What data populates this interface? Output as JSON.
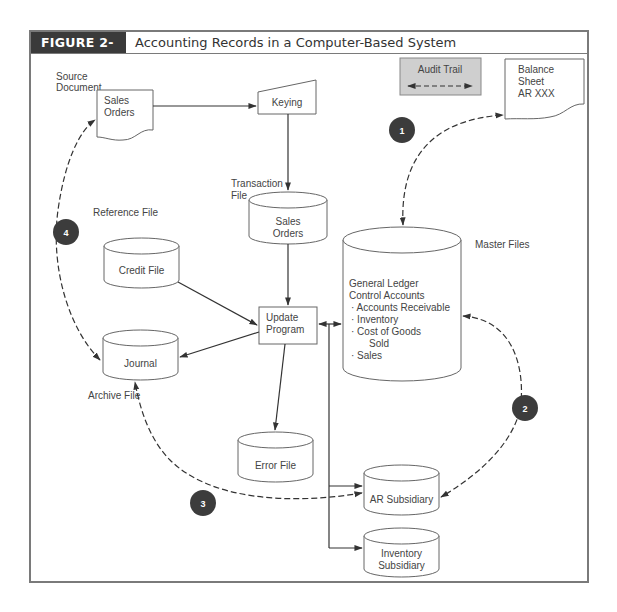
{
  "figure": {
    "label": "FIGURE 2-11",
    "title": "Accounting Records in a Computer-Based System"
  },
  "legend": {
    "audit_trail_label": "Audit Trail",
    "fill_color": "#cfcfcf"
  },
  "labels": {
    "source_document": [
      "Source",
      "Document"
    ],
    "transaction_file": [
      "Transaction",
      "File"
    ],
    "reference_file": "Reference File",
    "master_files": "Master Files",
    "archive_file": "Archive File"
  },
  "nodes": {
    "sales_orders_doc": [
      "Sales",
      "Orders"
    ],
    "keying": "Keying",
    "balance_sheet": [
      "Balance",
      "Sheet",
      "AR XXX"
    ],
    "sales_orders_file": [
      "Sales",
      "Orders"
    ],
    "credit_file": "Credit File",
    "update_program": [
      "Update",
      "Program"
    ],
    "journal": "Journal",
    "error_file": "Error File",
    "master_file": {
      "heading": [
        "General Ledger",
        "Control Accounts"
      ],
      "items": [
        "· Accounts Receivable",
        "· Inventory",
        "· Cost of Goods",
        "Sold",
        "· Sales"
      ]
    },
    "ar_subsidiary": "AR Subsidiary",
    "inventory_subsidiary": [
      "Inventory",
      "Subsidiary"
    ]
  },
  "badges": [
    "1",
    "2",
    "3",
    "4"
  ],
  "colors": {
    "badge": "#3c3c3c",
    "line": "#333333",
    "header_bg": "#3a3a3a",
    "border": "#7a7a7a"
  }
}
